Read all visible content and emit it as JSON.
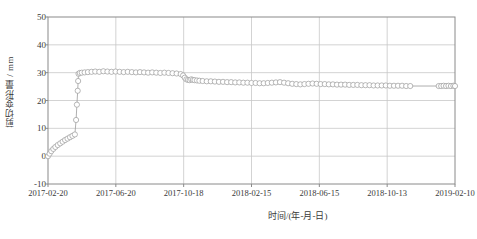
{
  "chart_data": {
    "type": "line",
    "title": "",
    "xlabel": "时间/(年-月-日)",
    "ylabel": "剪切变形量 / mm",
    "ylim": [
      -10,
      50
    ],
    "yticks": [
      -10,
      0,
      10,
      20,
      30,
      40,
      50
    ],
    "ytick_labels": [
      "-10",
      "0",
      "10",
      "20",
      "30",
      "40",
      "50"
    ],
    "xlim": [
      "2017-02-20",
      "2019-02-10"
    ],
    "xticks": [
      "2017-02-20",
      "2017-06-20",
      "2017-10-18",
      "2018-02-15",
      "2018-06-15",
      "2018-10-13",
      "2019-02-10"
    ],
    "grid": true,
    "legend": "none",
    "marker": "open-circle",
    "marker_size": 2.6,
    "line_color": "#9a9a9a",
    "marker_color": "#9a9a9a",
    "grid_color": "#c8c8c8",
    "axis_color": "#8a8a8a",
    "series": [
      {
        "name": "剪切变形量",
        "x": [
          0,
          0.004,
          0.008,
          0.013,
          0.018,
          0.024,
          0.03,
          0.036,
          0.042,
          0.048,
          0.054,
          0.06,
          0.066,
          0.069,
          0.071,
          0.073,
          0.074,
          0.075,
          0.078,
          0.083,
          0.09,
          0.098,
          0.107,
          0.116,
          0.126,
          0.136,
          0.146,
          0.156,
          0.166,
          0.176,
          0.186,
          0.196,
          0.206,
          0.216,
          0.226,
          0.236,
          0.246,
          0.256,
          0.266,
          0.276,
          0.286,
          0.296,
          0.306,
          0.316,
          0.326,
          0.332,
          0.336,
          0.34,
          0.344,
          0.348,
          0.352,
          0.356,
          0.36,
          0.366,
          0.372,
          0.38,
          0.39,
          0.4,
          0.41,
          0.42,
          0.43,
          0.44,
          0.45,
          0.46,
          0.47,
          0.48,
          0.49,
          0.5,
          0.51,
          0.52,
          0.53,
          0.54,
          0.55,
          0.56,
          0.57,
          0.58,
          0.59,
          0.6,
          0.61,
          0.62,
          0.63,
          0.64,
          0.65,
          0.66,
          0.67,
          0.68,
          0.69,
          0.7,
          0.71,
          0.72,
          0.73,
          0.74,
          0.75,
          0.76,
          0.77,
          0.78,
          0.79,
          0.8,
          0.81,
          0.82,
          0.83,
          0.84,
          0.85,
          0.86,
          0.87,
          0.88,
          0.89,
          0.96,
          0.966,
          0.972,
          0.978,
          0.984,
          0.99,
          0.996,
          1.0
        ],
        "y": [
          0.0,
          0.9,
          1.8,
          2.6,
          3.3,
          4.0,
          4.6,
          5.2,
          5.8,
          6.3,
          6.8,
          7.3,
          7.8,
          13.0,
          18.5,
          23.5,
          27.0,
          29.6,
          29.9,
          30.0,
          30.1,
          30.2,
          30.3,
          30.4,
          30.3,
          30.5,
          30.4,
          30.3,
          30.4,
          30.3,
          30.2,
          30.3,
          30.2,
          30.1,
          30.2,
          30.1,
          30.0,
          30.1,
          30.0,
          29.9,
          30.0,
          29.9,
          29.8,
          29.7,
          29.5,
          29.0,
          28.2,
          27.6,
          27.4,
          27.3,
          27.6,
          27.4,
          27.3,
          27.2,
          27.1,
          27.0,
          26.9,
          26.9,
          26.8,
          26.7,
          26.7,
          26.6,
          26.6,
          26.5,
          26.5,
          26.4,
          26.4,
          26.3,
          26.3,
          26.2,
          26.2,
          26.3,
          26.4,
          26.5,
          26.6,
          26.4,
          26.2,
          26.0,
          25.9,
          25.8,
          25.9,
          26.0,
          26.1,
          26.0,
          25.9,
          25.9,
          25.8,
          25.8,
          25.7,
          25.7,
          25.7,
          25.6,
          25.6,
          25.6,
          25.5,
          25.5,
          25.5,
          25.4,
          25.4,
          25.4,
          25.4,
          25.3,
          25.3,
          25.3,
          25.3,
          25.2,
          25.2,
          25.2,
          25.2,
          25.3,
          25.2,
          25.3,
          25.2,
          25.3,
          25.2
        ]
      }
    ]
  },
  "axes": {
    "plot_left": 48,
    "plot_right": 455,
    "plot_top": 17,
    "plot_bottom": 184
  }
}
